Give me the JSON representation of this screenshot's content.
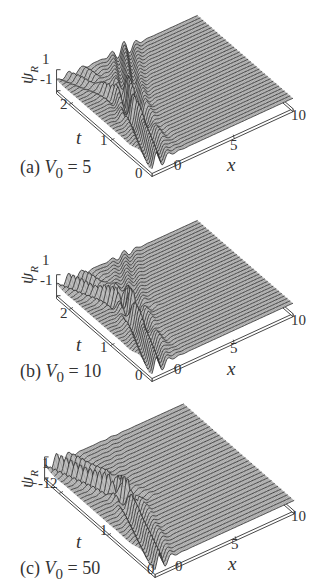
{
  "figure": {
    "panels": [
      {
        "id": "a",
        "caption_prefix": "(a) ",
        "caption_var": "V",
        "caption_sub": "0",
        "caption_eq": " = 5",
        "V0": 5
      },
      {
        "id": "b",
        "caption_prefix": "(b) ",
        "caption_var": "V",
        "caption_sub": "0",
        "caption_eq": " = 10",
        "V0": 10
      },
      {
        "id": "c",
        "caption_prefix": "(c) ",
        "caption_var": "V",
        "caption_sub": "0",
        "caption_eq": " = 50",
        "V0": 50
      }
    ],
    "axes": {
      "z_label": "ψ",
      "z_label_sub": "R",
      "z_ticks": [
        "1",
        "-1"
      ],
      "t_label": "t",
      "t_ticks": [
        "0",
        "1",
        "2"
      ],
      "x_label": "x",
      "x_ticks": [
        "0",
        "5",
        "10"
      ]
    }
  },
  "chart_data": [
    {
      "type": "surface",
      "title": "(a) V0 = 5",
      "xlabel": "x",
      "ylabel": "t",
      "zlabel": "ψ_R",
      "xlim": [
        -2,
        10
      ],
      "ylim": [
        0,
        2.3
      ],
      "zlim": [
        -1,
        1
      ],
      "x_ticks": [
        0,
        5,
        10
      ],
      "t_ticks": [
        0,
        1,
        2
      ],
      "z_ticks": [
        -1,
        1
      ],
      "description": "Wave packet incident from the left, reflecting at a barrier near x≈0; oscillations near x≈0–2, small transmitted part, decaying reflected ripples for t>1",
      "V0": 5
    },
    {
      "type": "surface",
      "title": "(b) V0 = 10",
      "xlabel": "x",
      "ylabel": "t",
      "zlabel": "ψ_R",
      "xlim": [
        -2,
        10
      ],
      "ylim": [
        0,
        2.3
      ],
      "zlim": [
        -1,
        1
      ],
      "x_ticks": [
        0,
        5,
        10
      ],
      "t_ticks": [
        0,
        1,
        2
      ],
      "z_ticks": [
        -1,
        1
      ],
      "description": "Stronger reflection: clear reflected wave crests moving to negative x for t>1, peak near x≈1 at t≈2",
      "V0": 10
    },
    {
      "type": "surface",
      "title": "(c) V0 = 50",
      "xlabel": "x",
      "ylabel": "t",
      "zlabel": "ψ_R",
      "xlim": [
        -2,
        10
      ],
      "ylim": [
        0,
        2.3
      ],
      "zlim": [
        -1,
        1
      ],
      "x_ticks": [
        0,
        5,
        10
      ],
      "t_ticks": [
        0,
        1,
        2
      ],
      "z_ticks": [
        -1,
        1
      ],
      "description": "Near-total reflection: wave crests bend back at x≈1, flat surface for x>2",
      "V0": 50
    }
  ]
}
